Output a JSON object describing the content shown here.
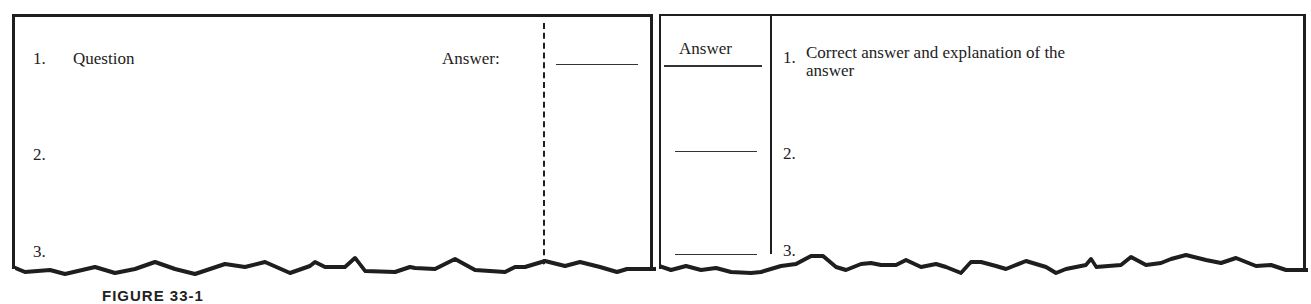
{
  "figure": {
    "caption": "FIGURE 33-1"
  },
  "question_sheet": {
    "items": [
      {
        "number": "1.",
        "text": "Question"
      },
      {
        "number": "2.",
        "text": ""
      },
      {
        "number": "3.",
        "text": ""
      }
    ],
    "answer_label": "Answer:"
  },
  "answer_sheet": {
    "column_header": "Answer",
    "items": [
      {
        "number": "1.",
        "text_line1": "Correct answer and  explanation of the",
        "text_line2": "answer"
      },
      {
        "number": "2.",
        "text_line1": "",
        "text_line2": ""
      },
      {
        "number": "3.",
        "text_line1": "",
        "text_line2": ""
      }
    ]
  },
  "colors": {
    "ink": "#1e1e1e",
    "paper": "#ffffff"
  }
}
